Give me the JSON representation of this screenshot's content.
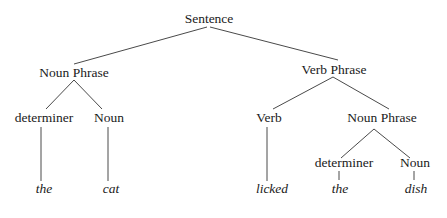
{
  "diagram": {
    "type": "parse-tree",
    "nodes": {
      "sentence": {
        "label": "Sentence",
        "x": 209,
        "y": 23
      },
      "np1": {
        "label": "Noun Phrase",
        "x": 74,
        "y": 77
      },
      "vp": {
        "label": "Verb Phrase",
        "x": 334,
        "y": 74
      },
      "det1": {
        "label": "determiner",
        "x": 44,
        "y": 122
      },
      "noun1": {
        "label": "Noun",
        "x": 109,
        "y": 122
      },
      "verb": {
        "label": "Verb",
        "x": 269,
        "y": 122
      },
      "np2": {
        "label": "Noun Phrase",
        "x": 382,
        "y": 122
      },
      "det2": {
        "label": "determiner",
        "x": 344,
        "y": 167
      },
      "noun2": {
        "label": "Noun",
        "x": 415,
        "y": 167
      }
    },
    "words": {
      "the1": {
        "label": "the",
        "x": 44,
        "y": 193
      },
      "cat": {
        "label": "cat",
        "x": 111,
        "y": 193
      },
      "licked": {
        "label": "licked",
        "x": 272,
        "y": 193
      },
      "the2": {
        "label": "the",
        "x": 340,
        "y": 193
      },
      "dish": {
        "label": "dish",
        "x": 416,
        "y": 193
      }
    },
    "edges": [
      {
        "from": "sentence",
        "to": "np1",
        "x1": 207,
        "y1": 27,
        "x2": 74,
        "y2": 64
      },
      {
        "from": "sentence",
        "to": "vp",
        "x1": 210,
        "y1": 27,
        "x2": 338,
        "y2": 60
      },
      {
        "from": "np1",
        "to": "det1",
        "x1": 74,
        "y1": 80,
        "x2": 46,
        "y2": 109
      },
      {
        "from": "np1",
        "to": "noun1",
        "x1": 74,
        "y1": 80,
        "x2": 102,
        "y2": 109
      },
      {
        "from": "vp",
        "to": "verb",
        "x1": 333,
        "y1": 77,
        "x2": 273,
        "y2": 109
      },
      {
        "from": "vp",
        "to": "np2",
        "x1": 333,
        "y1": 77,
        "x2": 389,
        "y2": 109
      },
      {
        "from": "np2",
        "to": "det2",
        "x1": 374,
        "y1": 129,
        "x2": 341,
        "y2": 158
      },
      {
        "from": "np2",
        "to": "noun2",
        "x1": 374,
        "y1": 129,
        "x2": 410,
        "y2": 158
      },
      {
        "from": "det1",
        "to": "the1",
        "x1": 41,
        "y1": 127,
        "x2": 41,
        "y2": 181
      },
      {
        "from": "noun1",
        "to": "cat",
        "x1": 108,
        "y1": 127,
        "x2": 108,
        "y2": 181
      },
      {
        "from": "verb",
        "to": "licked",
        "x1": 267,
        "y1": 127,
        "x2": 267,
        "y2": 181
      },
      {
        "from": "det2",
        "to": "the2",
        "x1": 339,
        "y1": 171,
        "x2": 339,
        "y2": 180
      },
      {
        "from": "noun2",
        "to": "dish",
        "x1": 414,
        "y1": 171,
        "x2": 414,
        "y2": 180
      }
    ]
  }
}
